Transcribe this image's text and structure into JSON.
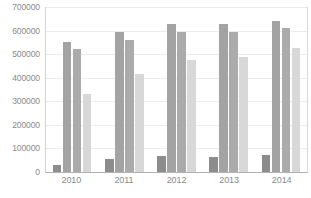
{
  "chart_data": {
    "type": "bar",
    "title": "",
    "subtitle": "",
    "xlabel": "",
    "ylabel": "",
    "categories": [
      "2010",
      "2011",
      "2012",
      "2013",
      "2014"
    ],
    "ylim": [
      0,
      700000
    ],
    "ytick_labels": [
      "0",
      "100000",
      "200000",
      "300000",
      "400000",
      "500000",
      "600000",
      "700000"
    ],
    "yticks": [
      0,
      100000,
      200000,
      300000,
      400000,
      500000,
      600000,
      700000
    ],
    "grid": true,
    "legend": "none",
    "series": [
      {
        "name": "series-1",
        "color": "#8c8c8c",
        "values": [
          30000,
          57000,
          68000,
          65000,
          72000
        ]
      },
      {
        "name": "series-2",
        "color": "#a3a3a3",
        "values": [
          550000,
          595000,
          630000,
          628000,
          640000
        ]
      },
      {
        "name": "series-3",
        "color": "#ababab",
        "values": [
          522000,
          562000,
          595000,
          593000,
          610000
        ]
      },
      {
        "name": "series-4",
        "color": "#d8d8d8",
        "values": [
          330000,
          415000,
          475000,
          490000,
          525000
        ]
      }
    ]
  },
  "colors": {
    "background": "#ffffff",
    "gridline": "#ececec",
    "axis": "#b0b0b0",
    "tick_text": "#8a8a8a"
  }
}
